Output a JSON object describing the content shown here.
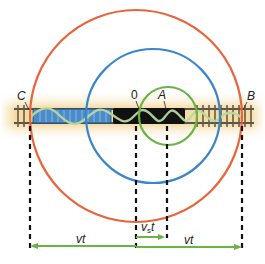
{
  "diagram": {
    "type": "doppler-wavefronts-moving-source",
    "colors": {
      "outer_wavefront": "#e8643a",
      "middle_wavefront": "#3a86c8",
      "inner_wavefront": "#6ab445",
      "arrow": "#6ab445",
      "dashed_line": "#111111",
      "track_glow": "#f3d79a",
      "train_blue": "#4a8cc9",
      "locomotive": "#111111",
      "wave_line": "#b8d8a0"
    },
    "points": {
      "C": "C",
      "origin": "0",
      "A": "A",
      "B": "B"
    },
    "wavefronts": [
      {
        "name": "outer",
        "center_x": 136,
        "radius": 106
      },
      {
        "name": "middle",
        "center_x": 153,
        "radius": 67
      },
      {
        "name": "inner",
        "center_x": 168,
        "radius": 29
      }
    ],
    "arrows": {
      "left_distance": {
        "label": "vt",
        "from": "0",
        "to": "C"
      },
      "right_distance": {
        "label": "vt",
        "from": "0",
        "to": "B"
      },
      "source_distance": {
        "label_main": "v",
        "label_sub": "s",
        "label_tail": "t",
        "from": "0",
        "to": "A"
      }
    }
  }
}
